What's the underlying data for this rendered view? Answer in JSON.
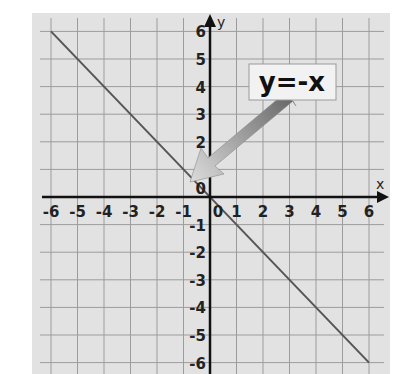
{
  "chart_data": {
    "type": "line",
    "title": "",
    "xlabel": "x",
    "ylabel": "y",
    "xlim": [
      -6,
      6
    ],
    "ylim": [
      -6,
      6
    ],
    "grid": true,
    "x_ticks": [
      -6,
      -5,
      -4,
      -3,
      -2,
      -1,
      0,
      1,
      2,
      3,
      4,
      5,
      6
    ],
    "y_ticks": [
      -6,
      -5,
      -4,
      -3,
      -2,
      -1,
      0,
      1,
      2,
      3,
      4,
      5,
      6
    ],
    "series": [
      {
        "name": "y=-x",
        "x": [
          -6,
          6
        ],
        "y": [
          6,
          -6
        ]
      }
    ],
    "annotations": [
      {
        "text": "y=-x",
        "type": "callout-arrow",
        "points_to": [
          -0.7,
          0.6
        ]
      }
    ]
  },
  "colors": {
    "background": "#e2e2e2",
    "grid": "#9c9c9c",
    "axis": "#111111",
    "line": "#555555",
    "arrow_dark": "#6a6a6a",
    "arrow_light": "#d8d8d8",
    "label_box": "#f2f2f2"
  },
  "labels": {
    "equation": "y=-x",
    "x_axis": "x",
    "y_axis": "y"
  }
}
